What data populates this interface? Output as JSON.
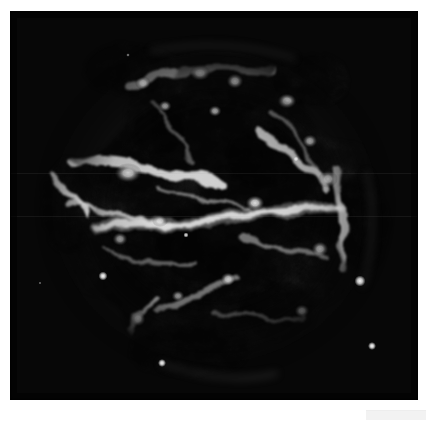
{
  "page": {
    "background_color": "#ffffff",
    "width": 434,
    "height": 423
  },
  "image_panel": {
    "name": "astronomical-image-panel",
    "x": 10,
    "y": 11,
    "width": 408,
    "height": 389,
    "background_color": "#000000",
    "colormap": "grayscale",
    "caption": ""
  },
  "corner_mark": {
    "label": "",
    "color": "#f2f2f2"
  },
  "chart_data": {
    "type": "heatmap",
    "title": "",
    "subtitle": "",
    "xlabel": "",
    "ylabel": "",
    "colormap": "grayscale",
    "grid": false,
    "legend_position": "none",
    "xlim": [
      0,
      408
    ],
    "ylim": [
      0,
      389
    ],
    "object": {
      "morphology": "shell-type supernova remnant",
      "center_x": 205,
      "center_y": 195,
      "radius_x": 158,
      "radius_y": 152,
      "peak_intensity": 255,
      "background_intensity": 4
    },
    "filaments": [
      {
        "name": "central-equatorial-filament",
        "x1": 85,
        "y1": 215,
        "x2": 330,
        "y2": 196,
        "width": 7,
        "intensity": 235
      },
      {
        "name": "central-filament-west-arm",
        "x1": 60,
        "y1": 196,
        "x2": 160,
        "y2": 212,
        "width": 6,
        "intensity": 215
      },
      {
        "name": "upper-west-bright-band",
        "x1": 66,
        "y1": 150,
        "x2": 205,
        "y2": 170,
        "width": 12,
        "intensity": 225
      },
      {
        "name": "northeast-arc",
        "x1": 250,
        "y1": 120,
        "x2": 320,
        "y2": 175,
        "width": 8,
        "intensity": 200
      },
      {
        "name": "east-vertical-filament",
        "x1": 325,
        "y1": 160,
        "x2": 338,
        "y2": 255,
        "width": 7,
        "intensity": 205
      },
      {
        "name": "west-edge-jet",
        "x1": 42,
        "y1": 165,
        "x2": 78,
        "y2": 205,
        "width": 6,
        "intensity": 230
      },
      {
        "name": "north-rim-arc",
        "x1": 120,
        "y1": 70,
        "x2": 265,
        "y2": 58,
        "width": 9,
        "intensity": 190
      },
      {
        "name": "south-diagonal-filament",
        "x1": 150,
        "y1": 300,
        "x2": 230,
        "y2": 265,
        "width": 6,
        "intensity": 180
      },
      {
        "name": "southwest-spur",
        "x1": 118,
        "y1": 320,
        "x2": 148,
        "y2": 290,
        "width": 5,
        "intensity": 195
      }
    ],
    "knots": [
      {
        "name": "knot-north-1",
        "x": 190,
        "y": 62,
        "r": 9,
        "intensity": 250
      },
      {
        "name": "knot-north-2",
        "x": 225,
        "y": 70,
        "r": 8,
        "intensity": 245
      },
      {
        "name": "knot-northwest",
        "x": 133,
        "y": 72,
        "r": 7,
        "intensity": 235
      },
      {
        "name": "knot-northeast",
        "x": 277,
        "y": 90,
        "r": 8,
        "intensity": 240
      },
      {
        "name": "knot-north-center",
        "x": 155,
        "y": 95,
        "r": 6,
        "intensity": 215
      },
      {
        "name": "knot-nne",
        "x": 205,
        "y": 100,
        "r": 6,
        "intensity": 215
      },
      {
        "name": "knot-east-upper",
        "x": 300,
        "y": 130,
        "r": 7,
        "intensity": 225
      },
      {
        "name": "knot-east-mid",
        "x": 318,
        "y": 168,
        "r": 9,
        "intensity": 235
      },
      {
        "name": "knot-west-band",
        "x": 118,
        "y": 162,
        "r": 11,
        "intensity": 245
      },
      {
        "name": "knot-center-bright",
        "x": 245,
        "y": 192,
        "r": 9,
        "intensity": 250
      },
      {
        "name": "knot-center-west",
        "x": 150,
        "y": 210,
        "r": 7,
        "intensity": 230
      },
      {
        "name": "knot-south-center",
        "x": 218,
        "y": 268,
        "r": 6,
        "intensity": 225
      },
      {
        "name": "point-source-sw",
        "x": 93,
        "y": 265,
        "r": 3,
        "intensity": 255
      },
      {
        "name": "point-source-se",
        "x": 350,
        "y": 270,
        "r": 4,
        "intensity": 255
      },
      {
        "name": "point-source-far-se",
        "x": 362,
        "y": 335,
        "r": 3,
        "intensity": 250
      },
      {
        "name": "point-source-south",
        "x": 152,
        "y": 352,
        "r": 3,
        "intensity": 250
      },
      {
        "name": "knot-southwest-tip",
        "x": 128,
        "y": 308,
        "r": 7,
        "intensity": 235
      },
      {
        "name": "knot-south-tail",
        "x": 238,
        "y": 370,
        "r": 5,
        "intensity": 200
      },
      {
        "name": "knot-se-shell",
        "x": 310,
        "y": 238,
        "r": 8,
        "intensity": 220
      },
      {
        "name": "knot-se-lower",
        "x": 292,
        "y": 300,
        "r": 7,
        "intensity": 205
      },
      {
        "name": "knot-sw-shell",
        "x": 110,
        "y": 228,
        "r": 7,
        "intensity": 215
      },
      {
        "name": "knot-center-diag",
        "x": 168,
        "y": 285,
        "r": 6,
        "intensity": 210
      }
    ],
    "dark_cavities": [
      {
        "name": "cavity-center",
        "x": 196,
        "y": 232,
        "rx": 48,
        "ry": 40
      },
      {
        "name": "cavity-north",
        "x": 250,
        "y": 148,
        "rx": 34,
        "ry": 28
      },
      {
        "name": "cavity-southeast",
        "x": 268,
        "y": 300,
        "rx": 36,
        "ry": 30
      },
      {
        "name": "cavity-southwest",
        "x": 108,
        "y": 292,
        "rx": 30,
        "ry": 34
      }
    ]
  }
}
